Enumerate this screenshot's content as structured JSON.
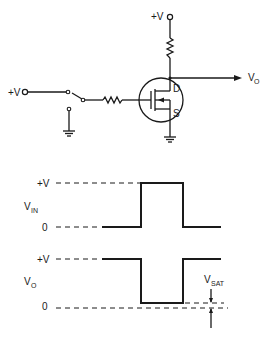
{
  "circuit": {
    "supply_top_label": "+V",
    "supply_left_label": "+V",
    "output_label": "V",
    "output_sub": "O",
    "drain_label": "D",
    "source_label": "S",
    "colors": {
      "ink": "#1a1a1a",
      "background": "#ffffff"
    }
  },
  "waveforms": {
    "vin": {
      "label": "V",
      "label_sub": "IN",
      "high_label": "+V",
      "low_label": "0"
    },
    "vo": {
      "label": "V",
      "label_sub": "O",
      "high_label": "+V",
      "low_label": "0",
      "vsat_label": "V",
      "vsat_sub": "SAT"
    }
  }
}
